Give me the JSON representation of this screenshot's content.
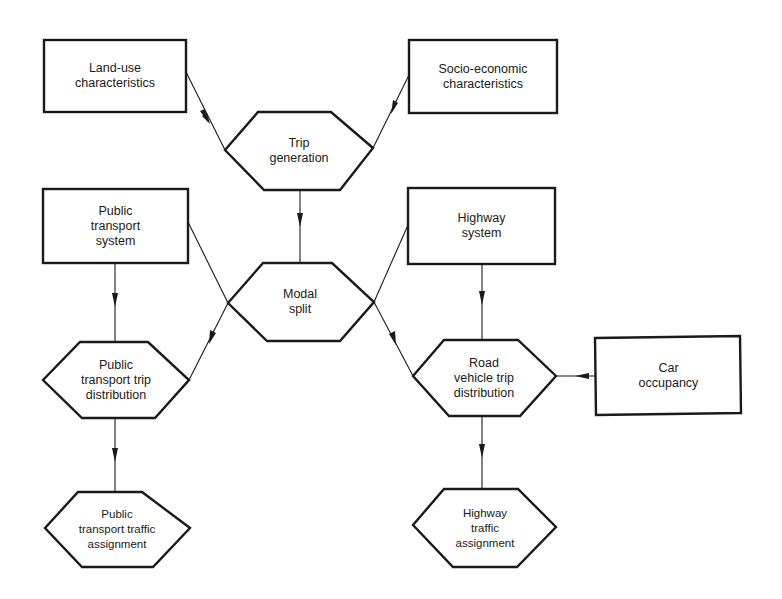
{
  "diagram": {
    "type": "flowchart",
    "topic": "Transport planning model process",
    "nodes": {
      "land_use": {
        "label": "Land-use\ncharacteristics",
        "shape": "rectangle"
      },
      "socio_economic": {
        "label": "Socio-economic\ncharacteristics",
        "shape": "rectangle"
      },
      "trip_generation": {
        "label": "Trip\ngeneration",
        "shape": "hexagon"
      },
      "public_transport_system": {
        "label": "Public\ntransport\nsystem",
        "shape": "rectangle"
      },
      "highway_system": {
        "label": "Highway\nsystem",
        "shape": "rectangle"
      },
      "modal_split": {
        "label": "Modal\nsplit",
        "shape": "hexagon"
      },
      "pt_trip_distribution": {
        "label": "Public\ntransport trip\ndistribution",
        "shape": "hexagon"
      },
      "road_trip_distribution": {
        "label": "Road\nvehicle trip\ndistribution",
        "shape": "hexagon"
      },
      "car_occupancy": {
        "label": "Car\noccupancy",
        "shape": "rectangle"
      },
      "pt_traffic_assignment": {
        "label": "Public\ntransport traffic\nassignment",
        "shape": "hexagon"
      },
      "highway_traffic_assignment": {
        "label": "Highway\ntraffic\nassignment",
        "shape": "hexagon"
      }
    },
    "edges": [
      {
        "from": "Land-use characteristics",
        "to": "Trip generation"
      },
      {
        "from": "Socio-economic characteristics",
        "to": "Trip generation"
      },
      {
        "from": "Trip generation",
        "to": "Modal split"
      },
      {
        "from": "Public transport system",
        "to": "Modal split"
      },
      {
        "from": "Highway system",
        "to": "Modal split"
      },
      {
        "from": "Public transport system",
        "to": "Public transport trip distribution"
      },
      {
        "from": "Modal split",
        "to": "Public transport trip distribution"
      },
      {
        "from": "Modal split",
        "to": "Road vehicle trip distribution"
      },
      {
        "from": "Highway system",
        "to": "Road vehicle trip distribution"
      },
      {
        "from": "Car occupancy",
        "to": "Road vehicle trip distribution"
      },
      {
        "from": "Public transport trip distribution",
        "to": "Public transport traffic assignment"
      },
      {
        "from": "Road vehicle trip distribution",
        "to": "Highway traffic assignment"
      }
    ],
    "colors": {
      "line": "#1a1a1a",
      "background": "#ffffff"
    }
  }
}
